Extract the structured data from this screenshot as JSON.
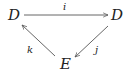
{
  "diagram": {
    "type": "commutative-triangle",
    "nodes": {
      "top_left": "D",
      "top_right": "D",
      "bottom": "E"
    },
    "edges": [
      {
        "from": "top_left",
        "to": "top_right",
        "label": "i"
      },
      {
        "from": "top_right",
        "to": "bottom",
        "label": "j"
      },
      {
        "from": "bottom",
        "to": "top_left",
        "label": "k"
      }
    ],
    "colors": {
      "stroke": "#555555",
      "text": "#222222"
    }
  }
}
